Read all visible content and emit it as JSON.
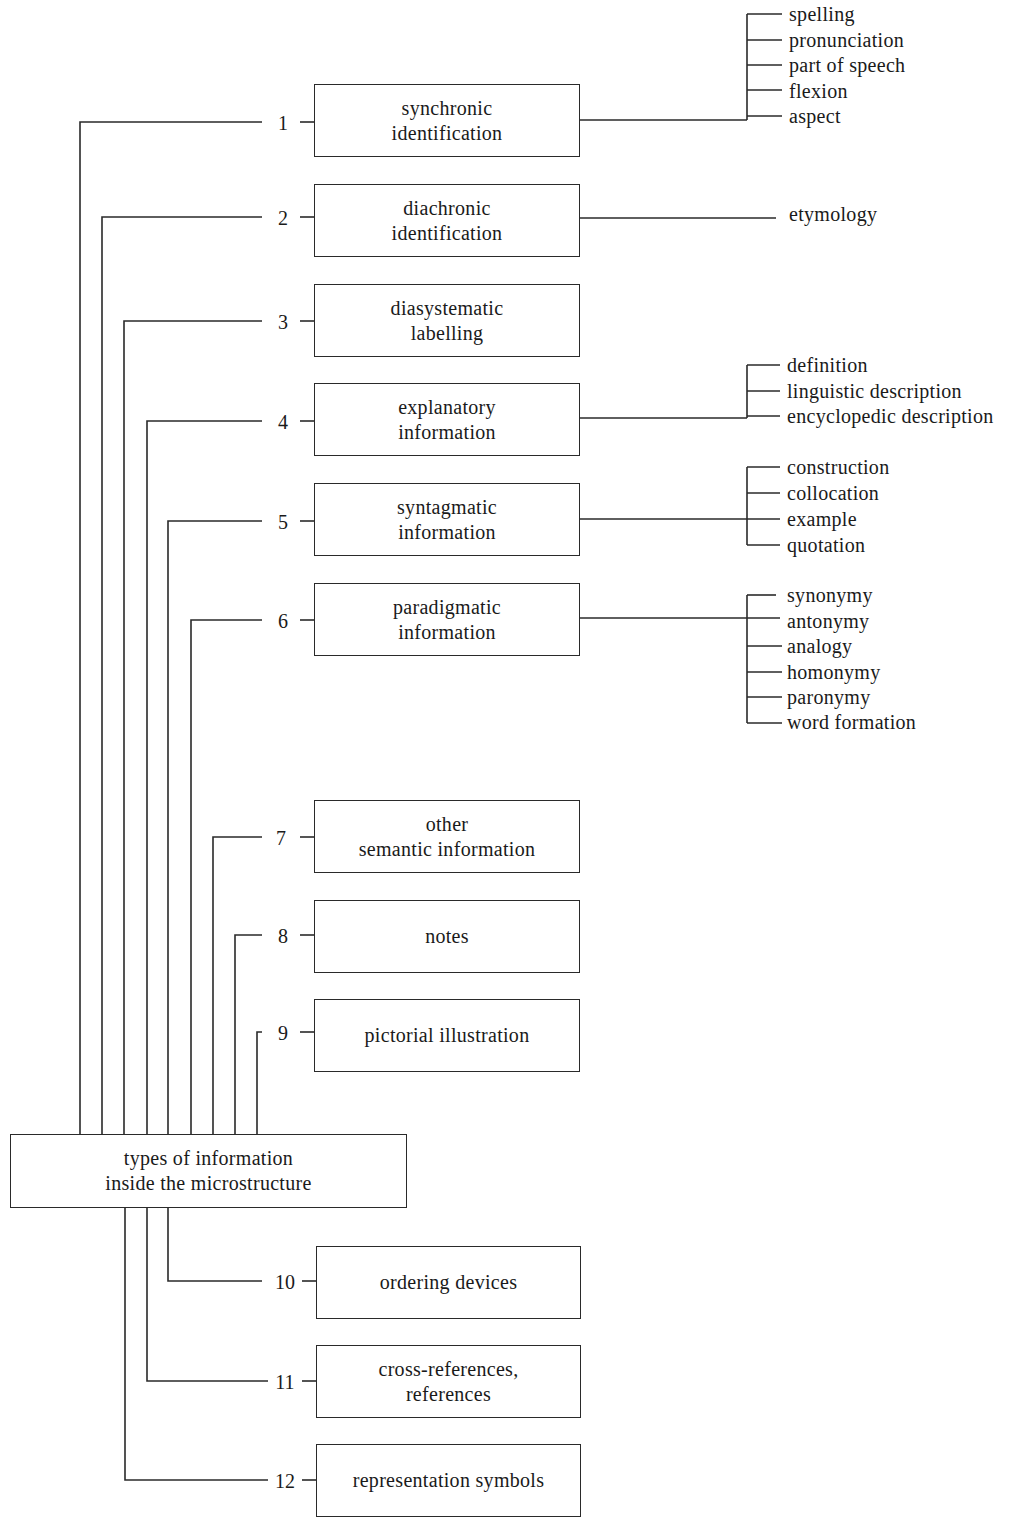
{
  "diagram": {
    "root": {
      "label": "types of information\ninside the microstructure"
    },
    "nodes": [
      {
        "number": "1",
        "label": "synchronic\nidentification",
        "children": [
          "spelling",
          "pronunciation",
          "part of speech",
          "flexion",
          "aspect"
        ]
      },
      {
        "number": "2",
        "label": "diachronic\nidentification",
        "children": [
          "etymology"
        ]
      },
      {
        "number": "3",
        "label": "diasystematic\nlabelling",
        "children": []
      },
      {
        "number": "4",
        "label": "explanatory\ninformation",
        "children": [
          "definition",
          "linguistic description",
          "encyclopedic description"
        ]
      },
      {
        "number": "5",
        "label": "syntagmatic\ninformation",
        "children": [
          "construction",
          "collocation",
          "example",
          "quotation"
        ]
      },
      {
        "number": "6",
        "label": "paradigmatic\ninformation",
        "children": [
          "synonymy",
          "antonymy",
          "analogy",
          "homonymy",
          "paronymy",
          "word formation"
        ]
      },
      {
        "number": "7",
        "label": "other\nsemantic information",
        "children": []
      },
      {
        "number": "8",
        "label": "notes",
        "children": []
      },
      {
        "number": "9",
        "label": "pictorial illustration",
        "children": []
      },
      {
        "number": "10",
        "label": "ordering devices",
        "children": []
      },
      {
        "number": "11",
        "label": "cross-references,\nreferences",
        "children": []
      },
      {
        "number": "12",
        "label": "representation symbols",
        "children": []
      }
    ],
    "colors": {
      "line": "#2a2a2a",
      "text": "#1a1a1a",
      "background": "#ffffff"
    }
  }
}
